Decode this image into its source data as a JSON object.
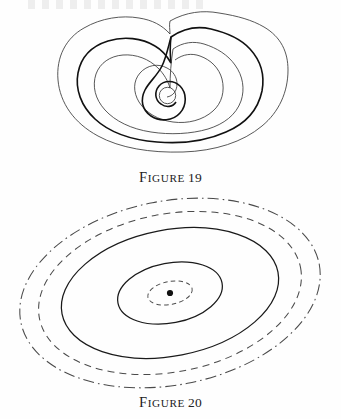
{
  "page": {
    "width": 341,
    "height": 419,
    "background_color": "#fefefe",
    "ink_color": "#1a1a1a"
  },
  "figures": [
    {
      "id": "figure-19",
      "caption_lead": "F",
      "caption_rest": "IGURE",
      "caption_number": "19",
      "caption_full": "FIGURE 19",
      "description": "Nested closed level curves forming a kidney/heart shaped contour family with an inward spiral terminating at a small circle",
      "curve_count": 6,
      "curves": [
        {
          "name": "outer-contour",
          "style": "thin",
          "stroke": "#3a3a3a",
          "width": 0.85
        },
        {
          "name": "second-contour",
          "style": "thick",
          "stroke": "#111111",
          "width": 1.6
        },
        {
          "name": "third-contour",
          "style": "thin",
          "stroke": "#3a3a3a",
          "width": 0.85
        },
        {
          "name": "spiral-outer-branch",
          "style": "thin",
          "stroke": "#3a3a3a",
          "width": 0.85
        },
        {
          "name": "spiral-inner-branch",
          "style": "thick",
          "stroke": "#111111",
          "width": 1.6
        },
        {
          "name": "center-circle",
          "style": "thin",
          "stroke": "#3a3a3a",
          "width": 0.85
        }
      ]
    },
    {
      "id": "figure-20",
      "caption_lead": "F",
      "caption_rest": "IGURE",
      "caption_number": "20",
      "caption_full": "FIGURE 20",
      "description": "Concentric tilted ellipses about a center point, drawn with alternating line styles from dash-dot outermost to dashed innermost",
      "tilt_degrees": -11,
      "center_point": {
        "x": 170,
        "y": 101,
        "radius": 3.1,
        "color": "#111111"
      },
      "curve_count": 5,
      "curves": [
        {
          "name": "ellipse-outermost",
          "style": "dash-dot",
          "rx": 152,
          "ry": 92,
          "stroke": "#4a4a4a",
          "width": 1.05
        },
        {
          "name": "ellipse-second",
          "style": "dashed",
          "rx": 133,
          "ry": 79,
          "stroke": "#4a4a4a",
          "width": 1.05
        },
        {
          "name": "ellipse-third",
          "style": "solid",
          "rx": 110,
          "ry": 63,
          "stroke": "#1a1a1a",
          "width": 1.25
        },
        {
          "name": "ellipse-fourth",
          "style": "solid",
          "rx": 53,
          "ry": 30,
          "stroke": "#1a1a1a",
          "width": 1.25
        },
        {
          "name": "ellipse-innermost",
          "style": "dashed-small",
          "rx": 22.5,
          "ry": 11.5,
          "stroke": "#4a4a4a",
          "width": 0.95
        }
      ]
    }
  ]
}
